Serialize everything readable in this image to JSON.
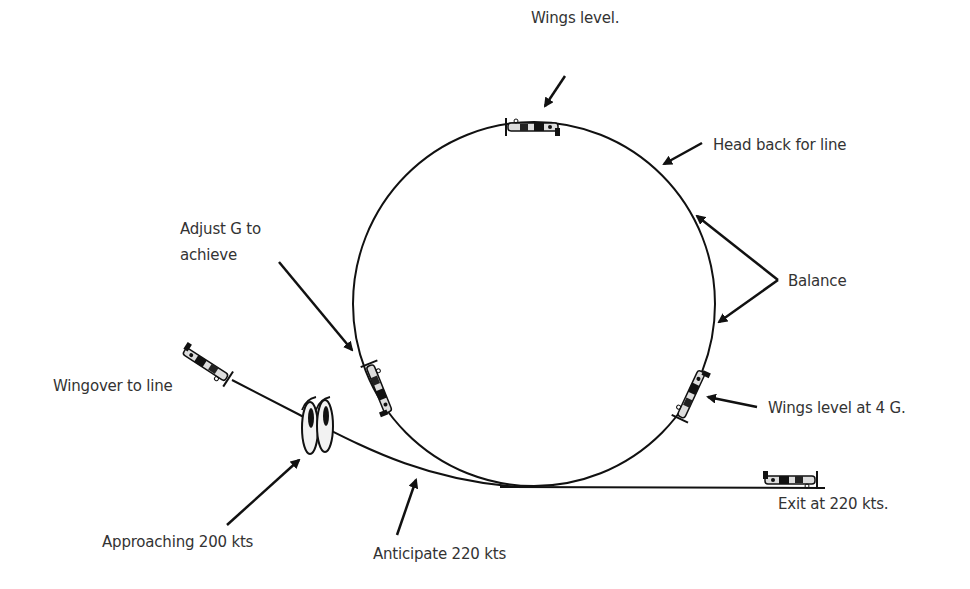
{
  "colors": {
    "background": "#ffffff",
    "line": "#111111",
    "text": "#333333"
  },
  "labels": {
    "wings_level_top": "Wings level.",
    "head_back": "Head back for line",
    "adjust_g_line1": "Adjust G to",
    "adjust_g_line2": "achieve",
    "balance": "Balance",
    "wingover": "Wingover to line",
    "wings_level_4g": "Wings level at 4 G.",
    "exit": "Exit at 220 kts.",
    "approaching": "Approaching 200 kts",
    "anticipate": "Anticipate 220 kts"
  },
  "icons": [
    "aircraft-icon-wingover",
    "aircraft-icon-loop-entry",
    "aircraft-icon-loop-top",
    "aircraft-icon-loop-descending",
    "aircraft-icon-exit",
    "eyes-icon"
  ]
}
